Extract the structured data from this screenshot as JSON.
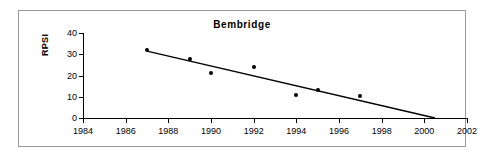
{
  "chart_data": {
    "type": "scatter",
    "title": "Bembridge",
    "xlabel": "",
    "ylabel": "RPSI",
    "xlim": [
      1984,
      2002
    ],
    "ylim": [
      0,
      40
    ],
    "xticks": [
      1984,
      1986,
      1988,
      1990,
      1992,
      1994,
      1996,
      1998,
      2000,
      2002
    ],
    "yticks": [
      0,
      10,
      20,
      30,
      40
    ],
    "grid": false,
    "legend": null,
    "series": [
      {
        "name": "RPSI",
        "marker": "filled-circle",
        "color": "#000000",
        "points": [
          {
            "x": 1987,
            "y": 32
          },
          {
            "x": 1989,
            "y": 28
          },
          {
            "x": 1990,
            "y": 21
          },
          {
            "x": 1992,
            "y": 24
          },
          {
            "x": 1994,
            "y": 11
          },
          {
            "x": 1995,
            "y": 13
          },
          {
            "x": 1997,
            "y": 10.5
          }
        ]
      },
      {
        "name": "trend-line",
        "type": "line",
        "color": "#000000",
        "points": [
          {
            "x": 1987,
            "y": 31.5
          },
          {
            "x": 2000.5,
            "y": 0
          }
        ]
      }
    ]
  },
  "axis": {
    "y_title": "RPSI",
    "x_tick_labels": [
      "1984",
      "1986",
      "1988",
      "1990",
      "1992",
      "1994",
      "1996",
      "1998",
      "2000",
      "2002"
    ],
    "y_tick_labels": [
      "0",
      "10",
      "20",
      "30",
      "40"
    ]
  }
}
